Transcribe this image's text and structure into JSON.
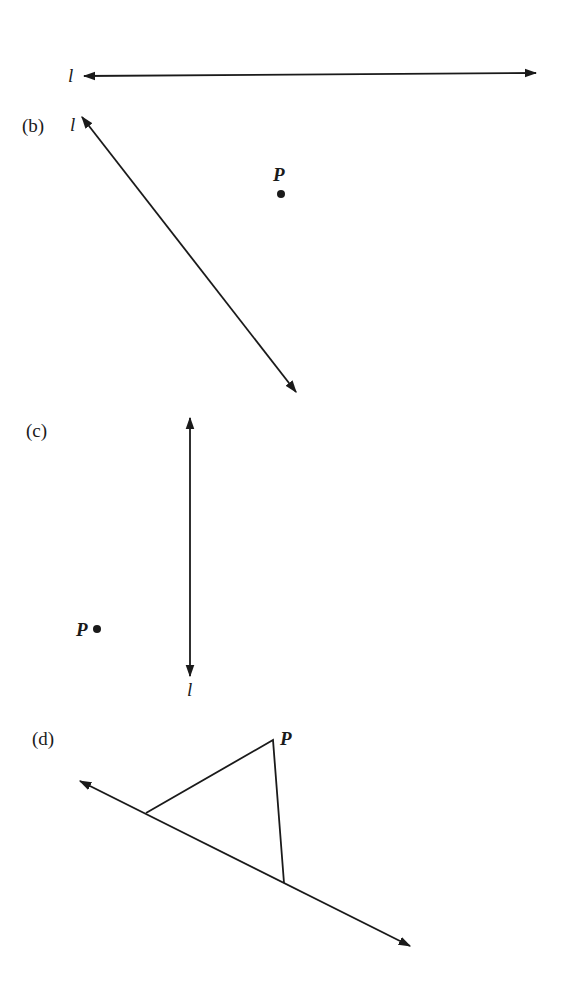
{
  "figure": {
    "panel_a": {
      "line_label": "l"
    },
    "panel_b": {
      "panel_label": "(b)",
      "line_label": "l",
      "point_label": "P"
    },
    "panel_c": {
      "panel_label": "(c)",
      "line_label": "l",
      "point_label": "P"
    },
    "panel_d": {
      "panel_label": "(d)",
      "point_label": "P"
    }
  },
  "colors": {
    "ink": "#1a1a1a",
    "background": "#ffffff"
  }
}
